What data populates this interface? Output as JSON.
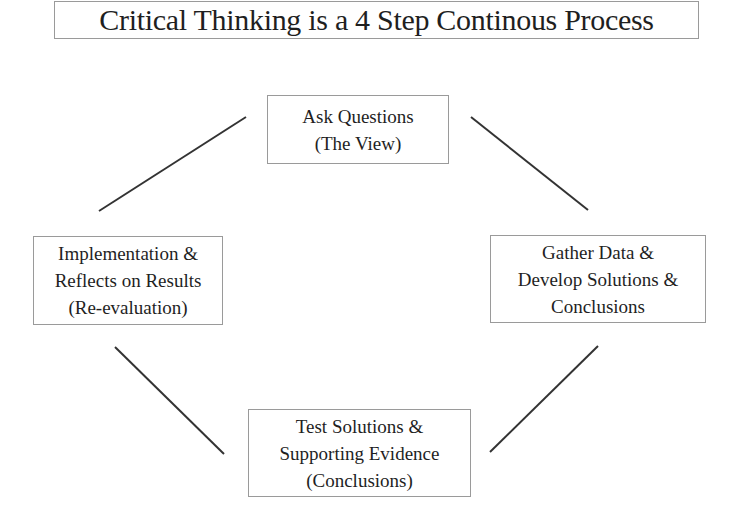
{
  "title": "Critical Thinking is a 4 Step Continous Process",
  "nodes": {
    "top": {
      "lines": [
        "Ask Questions",
        "(The View)"
      ]
    },
    "right": {
      "lines": [
        "Gather Data &",
        "Develop Solutions &",
        "Conclusions"
      ]
    },
    "bottom": {
      "lines": [
        "Test Solutions &",
        "Supporting Evidence",
        "(Conclusions)"
      ]
    },
    "left": {
      "lines": [
        "Implementation &",
        "Reflects on Results",
        "(Re-evaluation)"
      ]
    }
  },
  "connectors": [
    {
      "from": "left",
      "to": "top"
    },
    {
      "from": "top",
      "to": "right"
    },
    {
      "from": "right",
      "to": "bottom"
    },
    {
      "from": "bottom",
      "to": "left"
    }
  ],
  "colors": {
    "line": "#333333",
    "border": "#9a9a9a",
    "text": "#1f1f1f"
  }
}
